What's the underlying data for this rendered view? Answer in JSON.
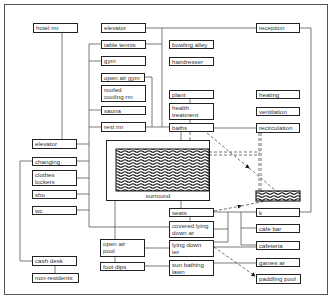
{
  "diagram": {
    "type": "hotel swimming pool facility relationship diagram",
    "boxes": [
      {
        "id": "hotel_rm",
        "label": "hotel rm",
        "x": 33,
        "y": 23,
        "w": 45,
        "h": 10
      },
      {
        "id": "elevator_top",
        "label": "elevator",
        "x": 101,
        "y": 23,
        "w": 45,
        "h": 10
      },
      {
        "id": "table_tennis",
        "label": "table tennis",
        "x": 101,
        "y": 40,
        "w": 45,
        "h": 9
      },
      {
        "id": "gym",
        "label": "gym",
        "x": 101,
        "y": 56,
        "w": 45,
        "h": 10
      },
      {
        "id": "open_air_gym",
        "label": "open air gym",
        "x": 101,
        "y": 73,
        "w": 44,
        "h": 9
      },
      {
        "id": "roofed_cooling_rm",
        "label": "roofed\ncooling rm",
        "x": 101,
        "y": 85,
        "w": 45,
        "h": 17
      },
      {
        "id": "sauna",
        "label": "sauna",
        "x": 101,
        "y": 106,
        "w": 45,
        "h": 9
      },
      {
        "id": "rest_rm",
        "label": "rest rm",
        "x": 101,
        "y": 122,
        "w": 45,
        "h": 10
      },
      {
        "id": "bowling_alley",
        "label": "bowling alley",
        "x": 169,
        "y": 40,
        "w": 45,
        "h": 9
      },
      {
        "id": "hairdresser",
        "label": "hairdresser",
        "x": 169,
        "y": 57,
        "w": 45,
        "h": 9
      },
      {
        "id": "plant",
        "label": "plant",
        "x": 169,
        "y": 90,
        "w": 45,
        "h": 9
      },
      {
        "id": "health_treatment",
        "label": "health\ntreatment",
        "x": 169,
        "y": 103,
        "w": 45,
        "h": 17
      },
      {
        "id": "baths",
        "label": "baths",
        "x": 169,
        "y": 123,
        "w": 45,
        "h": 9
      },
      {
        "id": "reception",
        "label": "reception",
        "x": 256,
        "y": 23,
        "w": 44,
        "h": 10
      },
      {
        "id": "heating",
        "label": "heating",
        "x": 256,
        "y": 90,
        "w": 44,
        "h": 9
      },
      {
        "id": "ventilation",
        "label": "ventilation",
        "x": 256,
        "y": 107,
        "w": 44,
        "h": 9
      },
      {
        "id": "recirculation",
        "label": "recirculation",
        "x": 256,
        "y": 123,
        "w": 44,
        "h": 10
      },
      {
        "id": "elevator_left",
        "label": "elevator",
        "x": 32,
        "y": 139,
        "w": 45,
        "h": 10
      },
      {
        "id": "changing",
        "label": "changing",
        "x": 32,
        "y": 157,
        "w": 45,
        "h": 9
      },
      {
        "id": "clothes_lockers",
        "label": "clothes\nlockers",
        "x": 32,
        "y": 170,
        "w": 45,
        "h": 16
      },
      {
        "id": "sho",
        "label": "sho",
        "x": 32,
        "y": 190,
        "w": 45,
        "h": 9
      },
      {
        "id": "wc",
        "label": "wc",
        "x": 32,
        "y": 206,
        "w": 45,
        "h": 9
      },
      {
        "id": "cash_desk",
        "label": "cash desk",
        "x": 32,
        "y": 256,
        "w": 45,
        "h": 10
      },
      {
        "id": "non_residents",
        "label": "non-residents",
        "x": 32,
        "y": 273,
        "w": 47,
        "h": 10
      },
      {
        "id": "seats",
        "label": "seats",
        "x": 169,
        "y": 208,
        "w": 45,
        "h": 9
      },
      {
        "id": "covered_lying_down_ar",
        "label": "covered lying\ndown ar",
        "x": 169,
        "y": 221,
        "w": 45,
        "h": 17
      },
      {
        "id": "lying_down_ter",
        "label": "lying down\nter",
        "x": 169,
        "y": 240,
        "w": 45,
        "h": 17
      },
      {
        "id": "sun_bathing_lawn",
        "label": "sun bathing\nlawn",
        "x": 169,
        "y": 260,
        "w": 45,
        "h": 16
      },
      {
        "id": "open_air_pool",
        "label": "open air\npool",
        "x": 100,
        "y": 239,
        "w": 45,
        "h": 18
      },
      {
        "id": "foot_dips",
        "label": "foot dips",
        "x": 100,
        "y": 262,
        "w": 45,
        "h": 9
      },
      {
        "id": "k",
        "label": "k",
        "x": 256,
        "y": 208,
        "w": 44,
        "h": 9
      },
      {
        "id": "cafe_bar",
        "label": "cafe bar",
        "x": 256,
        "y": 224,
        "w": 44,
        "h": 9
      },
      {
        "id": "cafeteria",
        "label": "cafeteria",
        "x": 256,
        "y": 241,
        "w": 44,
        "h": 9
      },
      {
        "id": "games_ar",
        "label": "games ar",
        "x": 256,
        "y": 258,
        "w": 44,
        "h": 9
      },
      {
        "id": "paddling_pool",
        "label": "paddling pool",
        "x": 256,
        "y": 274,
        "w": 45,
        "h": 10
      }
    ],
    "surround": {
      "label": "surround"
    },
    "colors": {
      "line": "#444444",
      "box_border": "#222222",
      "text": "#333333",
      "background": "#ffffff"
    }
  }
}
